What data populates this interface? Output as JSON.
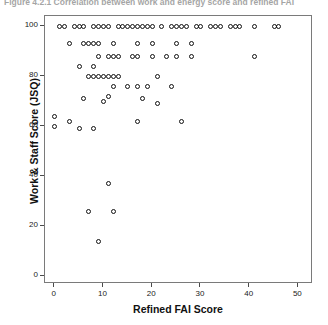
{
  "figure": {
    "caption": "Figure 4.2.1    Correlation between work and energy score and refined FAI"
  },
  "chart_data": {
    "type": "scatter",
    "title": "",
    "xlabel": "Refined FAI Score",
    "ylabel": "Work & Staff Score (JSQ)",
    "xlim": [
      -2,
      53
    ],
    "ylim": [
      -3,
      104
    ],
    "xticks": [
      0,
      10,
      20,
      30,
      40,
      50
    ],
    "yticks": [
      0,
      20,
      40,
      60,
      80,
      100
    ],
    "grid": false,
    "legend": null,
    "marker": "open-circle",
    "marker_color": "#111111",
    "points": [
      {
        "x": 1,
        "y": 100
      },
      {
        "x": 2,
        "y": 100
      },
      {
        "x": 4,
        "y": 100
      },
      {
        "x": 5,
        "y": 100
      },
      {
        "x": 6,
        "y": 100
      },
      {
        "x": 8,
        "y": 100
      },
      {
        "x": 9,
        "y": 100
      },
      {
        "x": 10,
        "y": 100
      },
      {
        "x": 11,
        "y": 100
      },
      {
        "x": 13,
        "y": 100
      },
      {
        "x": 14,
        "y": 100
      },
      {
        "x": 15,
        "y": 100
      },
      {
        "x": 16,
        "y": 100
      },
      {
        "x": 17,
        "y": 100
      },
      {
        "x": 18,
        "y": 100
      },
      {
        "x": 19,
        "y": 100
      },
      {
        "x": 20,
        "y": 100
      },
      {
        "x": 22,
        "y": 100
      },
      {
        "x": 24,
        "y": 100
      },
      {
        "x": 25,
        "y": 100
      },
      {
        "x": 26,
        "y": 100
      },
      {
        "x": 27,
        "y": 100
      },
      {
        "x": 29,
        "y": 100
      },
      {
        "x": 30,
        "y": 100
      },
      {
        "x": 32,
        "y": 100
      },
      {
        "x": 33,
        "y": 100
      },
      {
        "x": 34,
        "y": 100
      },
      {
        "x": 36,
        "y": 100
      },
      {
        "x": 37,
        "y": 100
      },
      {
        "x": 38,
        "y": 100
      },
      {
        "x": 41,
        "y": 100
      },
      {
        "x": 45,
        "y": 100
      },
      {
        "x": 46,
        "y": 100
      },
      {
        "x": 3,
        "y": 93
      },
      {
        "x": 6,
        "y": 93
      },
      {
        "x": 7,
        "y": 93
      },
      {
        "x": 8,
        "y": 93
      },
      {
        "x": 9,
        "y": 93
      },
      {
        "x": 12,
        "y": 93
      },
      {
        "x": 17,
        "y": 93
      },
      {
        "x": 20,
        "y": 93
      },
      {
        "x": 25,
        "y": 93
      },
      {
        "x": 28,
        "y": 93
      },
      {
        "x": 9,
        "y": 88
      },
      {
        "x": 11,
        "y": 88
      },
      {
        "x": 12,
        "y": 88
      },
      {
        "x": 13,
        "y": 88
      },
      {
        "x": 16,
        "y": 88
      },
      {
        "x": 17,
        "y": 88
      },
      {
        "x": 20,
        "y": 88
      },
      {
        "x": 23,
        "y": 88
      },
      {
        "x": 25,
        "y": 88
      },
      {
        "x": 28,
        "y": 88
      },
      {
        "x": 41,
        "y": 88
      },
      {
        "x": 5,
        "y": 84
      },
      {
        "x": 8,
        "y": 84
      },
      {
        "x": 7,
        "y": 80
      },
      {
        "x": 8,
        "y": 80
      },
      {
        "x": 9,
        "y": 80
      },
      {
        "x": 10,
        "y": 80
      },
      {
        "x": 11,
        "y": 80
      },
      {
        "x": 12,
        "y": 80
      },
      {
        "x": 13,
        "y": 80
      },
      {
        "x": 21,
        "y": 80
      },
      {
        "x": 12,
        "y": 76
      },
      {
        "x": 15,
        "y": 76
      },
      {
        "x": 17,
        "y": 76
      },
      {
        "x": 19,
        "y": 76
      },
      {
        "x": 24,
        "y": 76
      },
      {
        "x": 11,
        "y": 72
      },
      {
        "x": 6,
        "y": 71
      },
      {
        "x": 10,
        "y": 70
      },
      {
        "x": 18,
        "y": 71
      },
      {
        "x": 21,
        "y": 69
      },
      {
        "x": 0,
        "y": 64
      },
      {
        "x": 3,
        "y": 62
      },
      {
        "x": 17,
        "y": 62
      },
      {
        "x": 26,
        "y": 62
      },
      {
        "x": 5,
        "y": 59
      },
      {
        "x": 8,
        "y": 59
      },
      {
        "x": 0,
        "y": 60
      },
      {
        "x": 11,
        "y": 37
      },
      {
        "x": 7,
        "y": 26
      },
      {
        "x": 12,
        "y": 26
      },
      {
        "x": 9,
        "y": 14
      }
    ]
  }
}
